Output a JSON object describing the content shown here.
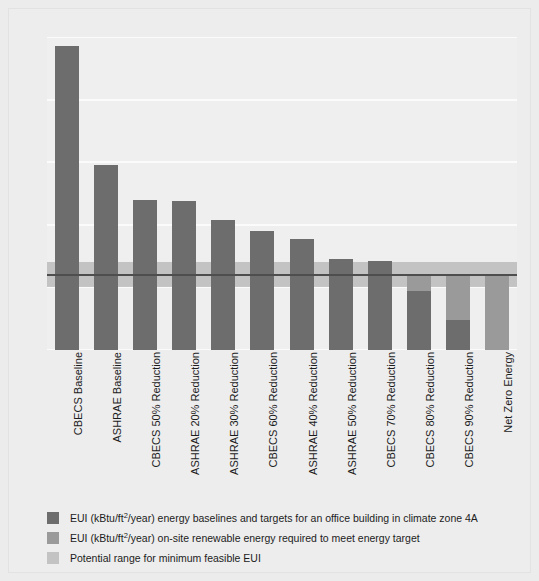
{
  "chart_data": {
    "type": "bar",
    "title": "",
    "subtitle": "",
    "xlabel": "",
    "ylabel": "",
    "ylim": [
      0,
      100
    ],
    "yticks": [
      0,
      20,
      40,
      60,
      80,
      100
    ],
    "ytick_labels": [
      "0",
      "20",
      "40",
      "60",
      "80",
      "100"
    ],
    "grid": true,
    "legend_position": "below",
    "stacked": true,
    "categories": [
      "CBECS Baseline",
      "ASHRAE Baseline",
      "CBECS 50% Reduction",
      "ASHRAE 20% Reduction",
      "ASHRAE 30% Reduction",
      "CBECS 60% Reduction",
      "ASHRAE 40% Reduction",
      "ASHRAE 50% Reduction",
      "CBECS 70% Reduction",
      "CBECS 80% Reduction",
      "CBECS 90% Reduction",
      "Net Zero Energy"
    ],
    "series": [
      {
        "name": "EUI (kBtu/ft2/year) energy baselines and targets for an office building in climate zone 4A",
        "color": "#6d6d6d",
        "values": [
          97,
          59,
          48,
          47.5,
          41.5,
          38,
          35.5,
          29,
          28.5,
          19,
          9.5,
          0
        ]
      },
      {
        "name": "EUI (kBtu/ft2/year) on-site renewable energy required to meet energy target",
        "color": "#9a9a9a",
        "values": [
          0,
          0,
          0,
          0,
          0,
          0,
          0,
          0,
          0,
          5,
          14.5,
          24
        ]
      }
    ],
    "annotations": {
      "range_band": {
        "label": "Potential range for minimum feasible EUI",
        "color": "#b4b4b4",
        "y_min": 20,
        "y_max": 28
      },
      "target_line": {
        "value": 24,
        "color": "#4e4e4e"
      }
    },
    "legend": [
      {
        "swatch": "eui",
        "text_prefix": "EUI (kBtu/ft",
        "text_sup": "2",
        "text_suffix": "/year) energy baselines and targets for an office building in climate zone 4A"
      },
      {
        "swatch": "renewable",
        "text_prefix": "EUI (kBtu/ft",
        "text_sup": "2",
        "text_suffix": "/year) on-site renewable energy required to meet energy target"
      },
      {
        "swatch": "range",
        "text_prefix": "Potential range for minimum feasible EUI",
        "text_sup": "",
        "text_suffix": ""
      }
    ],
    "colors": {
      "background": "#ececec",
      "plot_background": "#efefef",
      "gridline": "#fbfbfb",
      "bar_eui": "#6d6d6d",
      "bar_renewable": "#9a9a9a",
      "range_band": "#b4b4b4",
      "target_line": "#4e4e4e",
      "text": "#1c1c1c"
    }
  }
}
